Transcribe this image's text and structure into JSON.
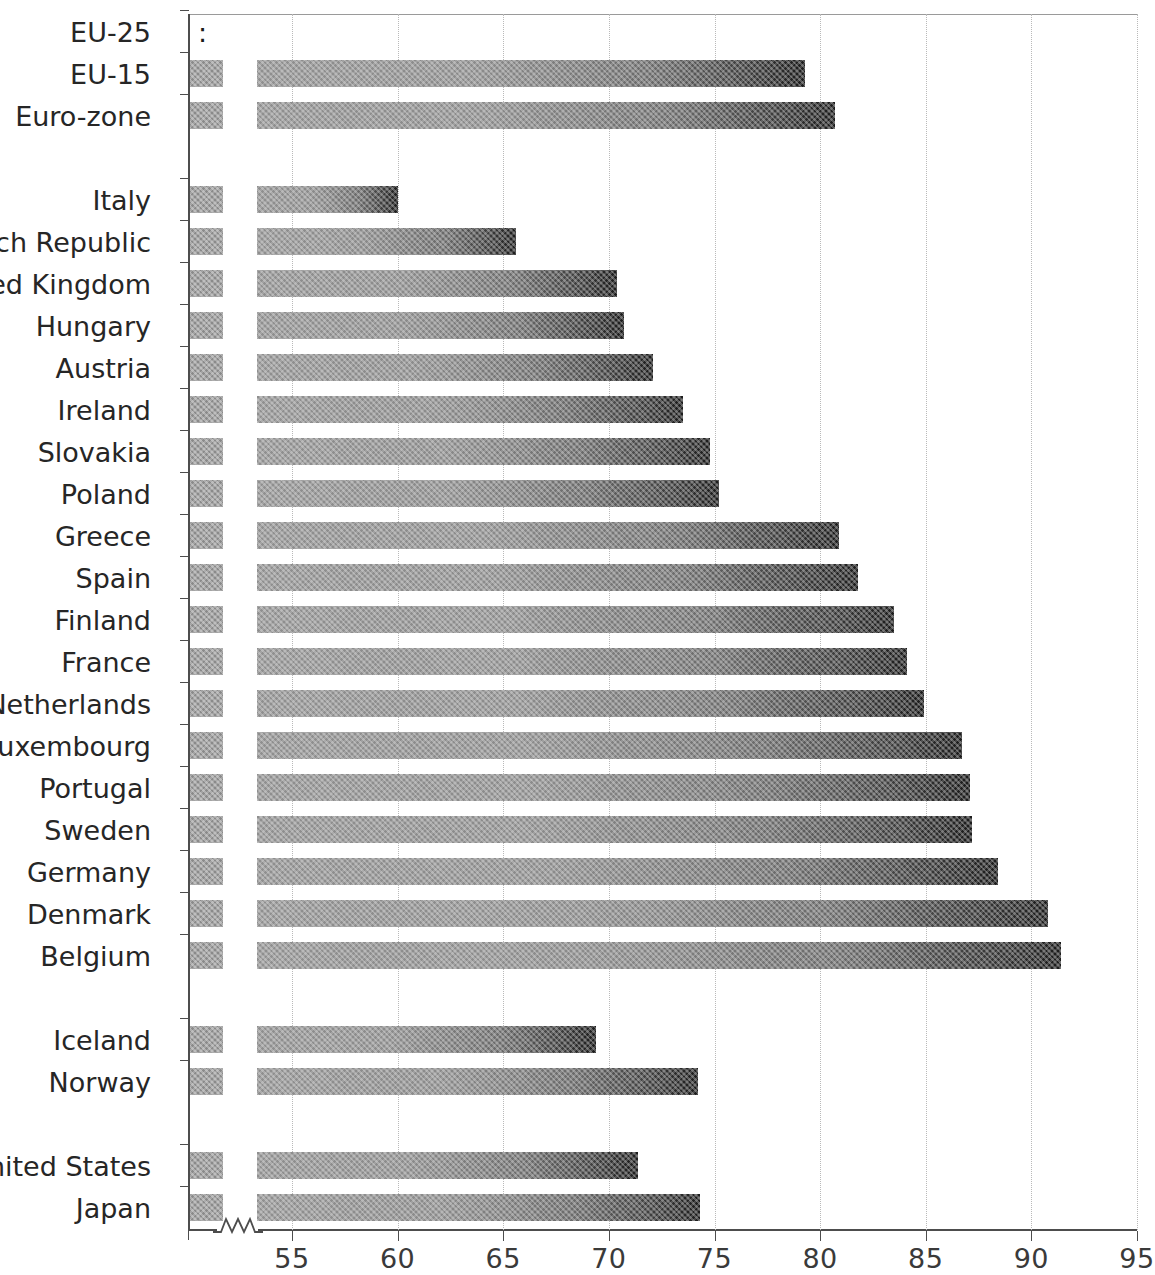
{
  "chart_data": {
    "type": "bar",
    "orientation": "horizontal",
    "title": "",
    "subtitle": "",
    "xlabel": "",
    "ylabel": "",
    "xlim": [
      52.2,
      95
    ],
    "axis_break": true,
    "axis_break_note": "zigzag break between axis origin and 53.5",
    "grid": "vertical dotted gridlines at every x tick",
    "legend": "none",
    "tick_values": [
      55,
      60,
      65,
      70,
      75,
      80,
      85,
      90,
      95
    ],
    "tick_labels": [
      "55",
      "60",
      "65",
      "70",
      "75",
      "80",
      "85",
      "90",
      "95"
    ],
    "missing_marker": ":",
    "categories": [
      "EU-25",
      "EU-15",
      "Euro-zone",
      "Italy",
      "Czech Republic",
      "United Kingdom",
      "Hungary",
      "Austria",
      "Ireland",
      "Slovakia",
      "Poland",
      "Greece",
      "Spain",
      "Finland",
      "France",
      "Netherlands",
      "Luxembourg",
      "Portugal",
      "Sweden",
      "Germany",
      "Denmark",
      "Belgium",
      "Iceland",
      "Norway",
      "United States",
      "Japan"
    ],
    "values": [
      null,
      79.3,
      80.7,
      60.0,
      65.6,
      70.4,
      70.7,
      72.1,
      73.5,
      74.8,
      75.2,
      80.9,
      81.8,
      83.5,
      84.1,
      84.9,
      86.7,
      87.1,
      87.2,
      88.4,
      90.8,
      91.4,
      69.4,
      74.2,
      71.4,
      74.3
    ],
    "groups": [
      {
        "name": "aggregates",
        "categories": [
          "EU-25",
          "EU-15",
          "Euro-zone"
        ]
      },
      {
        "name": "member-states",
        "categories": [
          "Italy",
          "Czech Republic",
          "United Kingdom",
          "Hungary",
          "Austria",
          "Ireland",
          "Slovakia",
          "Poland",
          "Greece",
          "Spain",
          "Finland",
          "France",
          "Netherlands",
          "Luxembourg",
          "Portugal",
          "Sweden",
          "Germany",
          "Denmark",
          "Belgium"
        ]
      },
      {
        "name": "efta",
        "categories": [
          "Iceland",
          "Norway"
        ]
      },
      {
        "name": "non-european",
        "categories": [
          "United States",
          "Japan"
        ]
      }
    ]
  },
  "colors": {
    "bar_light": "#8f8f8f",
    "bar_dark": "#1c1c1c",
    "stub": "#8a8a8a",
    "axis": "#4d4d4d",
    "gridline": "#b9b9b9",
    "text": "#262626"
  },
  "rows": [
    {
      "label": "EU-25",
      "value": null,
      "value_text": ":",
      "top": 18,
      "gap_after": false
    },
    {
      "label": "EU-15",
      "value": 79.3,
      "value_text": "79.3",
      "top": 60,
      "gap_after": false
    },
    {
      "label": "Euro-zone",
      "value": 80.7,
      "value_text": "80.7",
      "top": 102,
      "gap_after": true
    },
    {
      "label": "Italy",
      "value": 60.0,
      "value_text": "60.0",
      "top": 186,
      "gap_after": false
    },
    {
      "label": "Czech Republic",
      "value": 65.6,
      "value_text": "65.6",
      "top": 228,
      "gap_after": false
    },
    {
      "label": "United Kingdom",
      "value": 70.4,
      "value_text": "70.4",
      "top": 270,
      "gap_after": false
    },
    {
      "label": "Hungary",
      "value": 70.7,
      "value_text": "70.7",
      "top": 312,
      "gap_after": false
    },
    {
      "label": "Austria",
      "value": 72.1,
      "value_text": "72.1",
      "top": 354,
      "gap_after": false
    },
    {
      "label": "Ireland",
      "value": 73.5,
      "value_text": "73.5",
      "top": 396,
      "gap_after": false
    },
    {
      "label": "Slovakia",
      "value": 74.8,
      "value_text": "74.8",
      "top": 438,
      "gap_after": false
    },
    {
      "label": "Poland",
      "value": 75.2,
      "value_text": "75.2",
      "top": 480,
      "gap_after": false
    },
    {
      "label": "Greece",
      "value": 80.9,
      "value_text": "80.9",
      "top": 522,
      "gap_after": false
    },
    {
      "label": "Spain",
      "value": 81.8,
      "value_text": "81.8",
      "top": 564,
      "gap_after": false
    },
    {
      "label": "Finland",
      "value": 83.5,
      "value_text": "83.5",
      "top": 606,
      "gap_after": false
    },
    {
      "label": "France",
      "value": 84.1,
      "value_text": "84.1",
      "top": 648,
      "gap_after": false
    },
    {
      "label": "Netherlands",
      "value": 84.9,
      "value_text": "84.9",
      "top": 690,
      "gap_after": false
    },
    {
      "label": "Luxembourg",
      "value": 86.7,
      "value_text": "86.7",
      "top": 732,
      "gap_after": false
    },
    {
      "label": "Portugal",
      "value": 87.1,
      "value_text": "87.1",
      "top": 774,
      "gap_after": false
    },
    {
      "label": "Sweden",
      "value": 87.2,
      "value_text": "87.2",
      "top": 816,
      "gap_after": false
    },
    {
      "label": "Germany",
      "value": 88.4,
      "value_text": "88.4",
      "top": 858,
      "gap_after": false
    },
    {
      "label": "Denmark",
      "value": 90.8,
      "value_text": "90.8",
      "top": 900,
      "gap_after": false
    },
    {
      "label": "Belgium",
      "value": 91.4,
      "value_text": "91.4",
      "top": 942,
      "gap_after": true
    },
    {
      "label": "Iceland",
      "value": 69.4,
      "value_text": "69.4",
      "top": 1026,
      "gap_after": false
    },
    {
      "label": "Norway",
      "value": 74.2,
      "value_text": "74.2",
      "top": 1068,
      "gap_after": true
    },
    {
      "label": "United States",
      "value": 71.4,
      "value_text": "71.4",
      "top": 1152,
      "gap_after": false
    },
    {
      "label": "Japan",
      "value": 74.3,
      "value_text": "74.3",
      "top": 1194,
      "gap_after": false
    }
  ]
}
